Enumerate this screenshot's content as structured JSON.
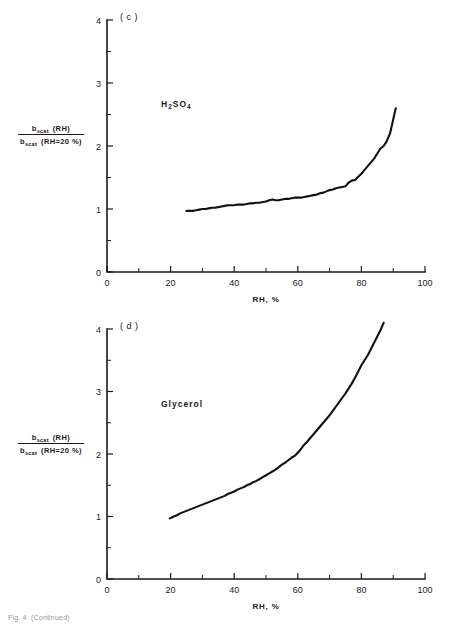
{
  "figure": {
    "caption_fragment": "Fig. 4. (Continued)"
  },
  "panels": [
    {
      "tag": "( c )",
      "series_label_html": "H<sub>2</sub>SO<sub>4</sub>",
      "series_label_text": "H2SO4",
      "ylabel": {
        "numerator_symbol": "b",
        "numerator_subscript": "scat",
        "numerator_arg": "(RH)",
        "denominator_symbol": "b",
        "denominator_subscript": "scat",
        "denominator_arg": "(RH=20 %)"
      },
      "xlabel": "RH, %",
      "xticks": [
        "0",
        "20",
        "40",
        "60",
        "80",
        "100"
      ],
      "yticks": [
        "0",
        "1",
        "2",
        "3",
        "4"
      ]
    },
    {
      "tag": "( d )",
      "series_label_html": "Glycerol",
      "series_label_text": "Glycerol",
      "ylabel": {
        "numerator_symbol": "b",
        "numerator_subscript": "scat",
        "numerator_arg": "(RH)",
        "denominator_symbol": "b",
        "denominator_subscript": "scat",
        "denominator_arg": "(RH=20 %)"
      },
      "xlabel": "RH, %",
      "xticks": [
        "0",
        "20",
        "40",
        "60",
        "80",
        "100"
      ],
      "yticks": [
        "0",
        "1",
        "2",
        "3",
        "4"
      ]
    }
  ],
  "chart_data": [
    {
      "type": "line",
      "panel": "(c)",
      "title": "H2SO4",
      "xlabel": "RH, %",
      "ylabel": "b_scat(RH) / b_scat(RH=20%)",
      "xlim": [
        0,
        100
      ],
      "ylim": [
        0,
        4
      ],
      "xticks": [
        0,
        20,
        40,
        60,
        80,
        100
      ],
      "yticks": [
        0,
        1,
        2,
        3,
        4
      ],
      "xminor_step": 10,
      "yminor_step": 0.5,
      "grid": false,
      "legend": "none",
      "series": [
        {
          "name": "H2SO4",
          "x": [
            25.0,
            26.0,
            27.0,
            28.0,
            29.0,
            30.0,
            31.0,
            32.0,
            33.0,
            34.0,
            35.0,
            36.0,
            37.0,
            38.0,
            39.0,
            40.0,
            41.0,
            42.0,
            43.0,
            44.0,
            45.0,
            46.0,
            47.0,
            48.0,
            49.0,
            50.0,
            51.0,
            52.0,
            53.0,
            54.0,
            55.0,
            56.0,
            57.0,
            58.0,
            59.0,
            60.0,
            61.0,
            62.0,
            63.0,
            64.0,
            65.0,
            66.0,
            67.0,
            68.0,
            69.0,
            70.0,
            71.0,
            72.0,
            73.0,
            74.0,
            75.0,
            76.0,
            77.0,
            78.0,
            79.0,
            80.0,
            81.0,
            82.0,
            83.0,
            84.0,
            85.0,
            86.0,
            87.0,
            88.0,
            89.0,
            90.0,
            90.8
          ],
          "y": [
            0.97,
            0.97,
            0.97,
            0.98,
            0.99,
            1.0,
            1.0,
            1.01,
            1.02,
            1.02,
            1.03,
            1.04,
            1.05,
            1.06,
            1.06,
            1.06,
            1.07,
            1.07,
            1.07,
            1.08,
            1.09,
            1.09,
            1.1,
            1.1,
            1.11,
            1.12,
            1.14,
            1.15,
            1.14,
            1.14,
            1.15,
            1.16,
            1.16,
            1.17,
            1.18,
            1.18,
            1.18,
            1.19,
            1.2,
            1.21,
            1.22,
            1.23,
            1.25,
            1.26,
            1.28,
            1.3,
            1.31,
            1.33,
            1.34,
            1.35,
            1.36,
            1.42,
            1.45,
            1.46,
            1.51,
            1.56,
            1.62,
            1.68,
            1.74,
            1.8,
            1.88,
            1.96,
            2.0,
            2.08,
            2.2,
            2.42,
            2.6
          ]
        }
      ]
    },
    {
      "type": "line",
      "panel": "(d)",
      "title": "Glycerol",
      "xlabel": "RH, %",
      "ylabel": "b_scat(RH) / b_scat(RH=20%)",
      "xlim": [
        0,
        100
      ],
      "ylim": [
        0,
        4
      ],
      "xticks": [
        0,
        20,
        40,
        60,
        80,
        100
      ],
      "yticks": [
        0,
        1,
        2,
        3,
        4
      ],
      "xminor_step": 10,
      "yminor_step": 0.5,
      "grid": false,
      "legend": "none",
      "series": [
        {
          "name": "Glycerol",
          "x": [
            19.8,
            21.0,
            22.0,
            23.0,
            24.0,
            25.0,
            26.0,
            27.0,
            28.0,
            29.0,
            30.0,
            31.0,
            32.0,
            33.0,
            34.0,
            35.0,
            36.0,
            37.0,
            38.0,
            39.0,
            40.0,
            41.0,
            42.0,
            43.0,
            44.0,
            45.0,
            46.0,
            47.0,
            48.0,
            49.0,
            50.0,
            51.0,
            52.0,
            53.0,
            54.0,
            55.0,
            56.0,
            57.0,
            58.0,
            59.0,
            60.0,
            61.0,
            62.0,
            63.0,
            64.0,
            65.0,
            66.0,
            67.0,
            68.0,
            69.0,
            70.0,
            71.0,
            72.0,
            73.0,
            74.0,
            75.0,
            76.0,
            77.0,
            78.0,
            79.0,
            80.0,
            81.0,
            82.0,
            83.0,
            84.0,
            85.0,
            86.0,
            87.0
          ],
          "y": [
            0.97,
            1.0,
            1.02,
            1.05,
            1.07,
            1.09,
            1.11,
            1.13,
            1.15,
            1.17,
            1.19,
            1.21,
            1.23,
            1.25,
            1.27,
            1.29,
            1.31,
            1.33,
            1.36,
            1.38,
            1.4,
            1.43,
            1.45,
            1.47,
            1.5,
            1.52,
            1.55,
            1.57,
            1.6,
            1.63,
            1.66,
            1.69,
            1.72,
            1.75,
            1.79,
            1.83,
            1.86,
            1.9,
            1.94,
            1.97,
            2.02,
            2.08,
            2.15,
            2.2,
            2.26,
            2.32,
            2.38,
            2.44,
            2.5,
            2.56,
            2.62,
            2.69,
            2.76,
            2.83,
            2.9,
            2.97,
            3.05,
            3.13,
            3.22,
            3.32,
            3.42,
            3.5,
            3.58,
            3.68,
            3.78,
            3.88,
            3.98,
            4.1
          ]
        }
      ]
    }
  ]
}
